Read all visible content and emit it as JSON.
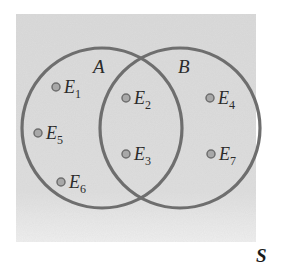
{
  "diagram": {
    "type": "venn",
    "universe_label": "S",
    "sets": [
      {
        "name": "A",
        "label": "A"
      },
      {
        "name": "B",
        "label": "B"
      }
    ],
    "events": [
      {
        "letter": "E",
        "index": "1",
        "region": "A only"
      },
      {
        "letter": "E",
        "index": "5",
        "region": "A only"
      },
      {
        "letter": "E",
        "index": "6",
        "region": "A only"
      },
      {
        "letter": "E",
        "index": "2",
        "region": "A and B"
      },
      {
        "letter": "E",
        "index": "3",
        "region": "A and B"
      },
      {
        "letter": "E",
        "index": "4",
        "region": "B only"
      },
      {
        "letter": "E",
        "index": "7",
        "region": "B only"
      }
    ],
    "colors": {
      "background": "#dcdcdc",
      "circle_stroke": "#6e6e6e",
      "dot_fill": "#a8a8a8",
      "dot_stroke": "#6e6e6e",
      "text": "#2b2b2b"
    }
  }
}
